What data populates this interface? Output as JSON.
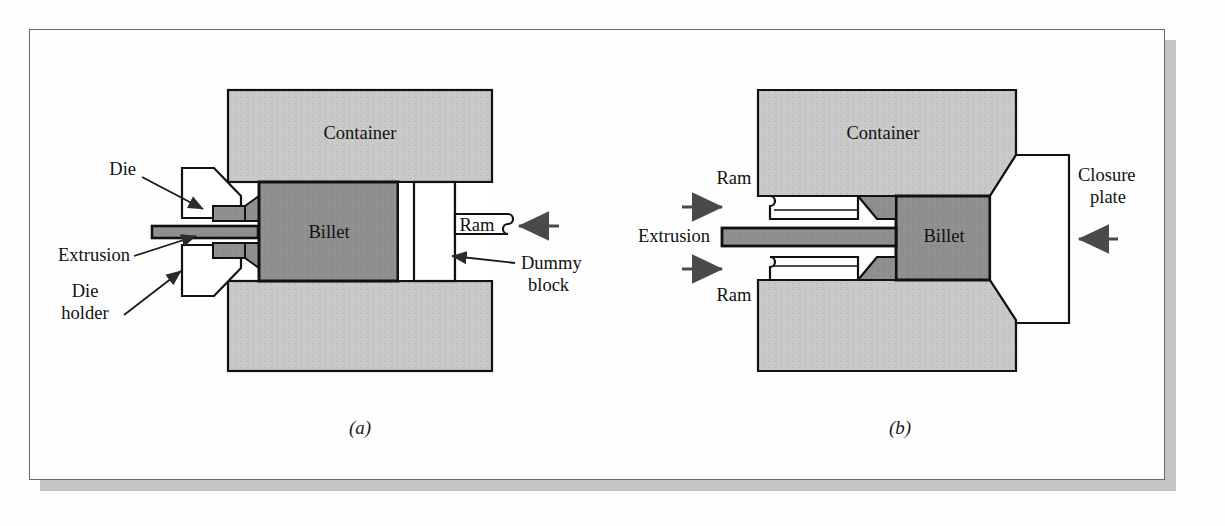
{
  "figure": {
    "background_color": "#fdfdfd",
    "panel_border_color": "#6b6b6b",
    "shadow_color": "#c4c4c4"
  },
  "colors": {
    "container_gray": "#c8c8c8",
    "billet_gray": "#8c8c8c",
    "die_gray": "#9a9a9a",
    "white_part": "#ffffff",
    "outline": "#111111",
    "arrow": "#3a3a3a"
  },
  "panel_a": {
    "caption": "(a)",
    "process_name": "direct extrusion",
    "labels": {
      "container": "Container",
      "billet": "Billet",
      "ram": "Ram",
      "die": "Die",
      "extrusion": "Extrusion",
      "die_holder_line1": "Die",
      "die_holder_line2": "holder",
      "dummy_block_line1": "Dummy",
      "dummy_block_line2": "block"
    },
    "arrows": [
      {
        "name": "ram-force-arrow",
        "direction": "left",
        "points_to": "ram"
      }
    ],
    "leaders": [
      {
        "from": "die-label",
        "to": "die-part"
      },
      {
        "from": "extrusion-label",
        "to": "extrusion-part"
      },
      {
        "from": "die-holder-label",
        "to": "die-holder-part"
      },
      {
        "from": "dummy-block-label",
        "to": "dummy-block-part"
      }
    ]
  },
  "panel_b": {
    "caption": "(b)",
    "process_name": "indirect extrusion",
    "labels": {
      "container": "Container",
      "billet": "Billet",
      "ram_top": "Ram",
      "ram_bottom": "Ram",
      "extrusion": "Extrusion",
      "closure_plate_line1": "Closure",
      "closure_plate_line2": "plate"
    },
    "arrows": [
      {
        "name": "ram-top-force-arrow",
        "direction": "right",
        "points_to": "ram-top"
      },
      {
        "name": "ram-bottom-force-arrow",
        "direction": "right",
        "points_to": "ram-bottom"
      },
      {
        "name": "closure-plate-force-arrow",
        "direction": "left",
        "points_to": "closure-plate"
      }
    ]
  }
}
